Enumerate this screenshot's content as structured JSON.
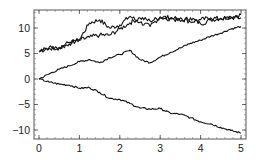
{
  "chart_data": {
    "type": "line",
    "title": "",
    "xlabel": "",
    "ylabel": "",
    "xlim": [
      -0.12,
      5.12
    ],
    "ylim": [
      -11.8,
      13.4
    ],
    "grid": false,
    "legend": null,
    "x_ticks": [
      0,
      1,
      2,
      3,
      4,
      5
    ],
    "x_tick_labels": [
      "0",
      "1",
      "2",
      "3",
      "4",
      "5"
    ],
    "y_ticks": [
      -10,
      -5,
      0,
      5,
      10
    ],
    "y_tick_labels": [
      "-10",
      "-5",
      "0",
      "5",
      "10"
    ],
    "x": [
      0,
      0.25,
      0.5,
      0.75,
      1.0,
      1.25,
      1.5,
      1.75,
      2.0,
      2.25,
      2.5,
      2.75,
      3.0,
      3.25,
      3.5,
      3.75,
      4.0,
      4.25,
      4.5,
      4.75,
      5.0
    ],
    "series": [
      {
        "name": "path-1",
        "values": [
          5.3,
          6.2,
          6.0,
          6.9,
          7.7,
          11.0,
          11.6,
          10.0,
          10.6,
          12.3,
          11.1,
          10.3,
          12.2,
          12.0,
          11.3,
          12.0,
          10.8,
          11.6,
          11.9,
          12.2,
          12.6
        ]
      },
      {
        "name": "path-2",
        "values": [
          5.5,
          6.0,
          6.2,
          7.2,
          7.6,
          8.2,
          8.6,
          8.6,
          9.8,
          11.0,
          12.0,
          11.4,
          12.0,
          11.8,
          12.0,
          11.2,
          11.6,
          12.0,
          11.8,
          12.0,
          12.0
        ]
      },
      {
        "name": "path-3",
        "values": [
          0.0,
          1.0,
          1.9,
          2.6,
          3.4,
          3.8,
          3.2,
          4.2,
          4.8,
          5.6,
          3.8,
          3.2,
          4.3,
          5.2,
          6.1,
          7.0,
          7.6,
          8.4,
          9.0,
          9.8,
          10.3
        ]
      },
      {
        "name": "path-4",
        "values": [
          0.0,
          -0.6,
          -1.0,
          -1.2,
          -1.8,
          -1.7,
          -2.6,
          -3.8,
          -4.0,
          -4.8,
          -5.7,
          -5.9,
          -5.8,
          -6.7,
          -6.9,
          -7.6,
          -8.4,
          -8.8,
          -9.5,
          -10.1,
          -10.6
        ]
      }
    ],
    "line_color": "#111111"
  }
}
